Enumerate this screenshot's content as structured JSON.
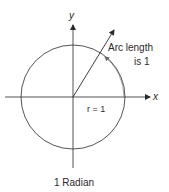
{
  "diagram": {
    "axes": {
      "x_label": "x",
      "y_label": "y"
    },
    "arc_label_line1": "Arc length",
    "arc_label_line2": "is 1",
    "radius_label": "r = 1",
    "caption": "1 Radian",
    "colors": {
      "stroke": "#2a2a2a",
      "arc_arrow": "#6a6a6a",
      "background": "#ffffff"
    }
  }
}
